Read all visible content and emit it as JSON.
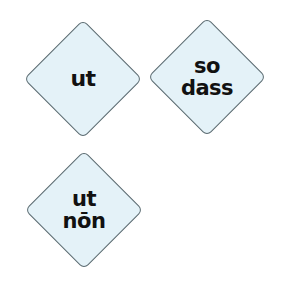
{
  "cards": [
    {
      "lines": [
        "ut"
      ]
    },
    {
      "lines": [
        "so",
        "dass"
      ]
    },
    {
      "lines": [
        "ut",
        "nōn"
      ]
    }
  ],
  "colors": {
    "fill": "#e4f2f8",
    "border": "#5a6a70",
    "text": "#111111"
  }
}
